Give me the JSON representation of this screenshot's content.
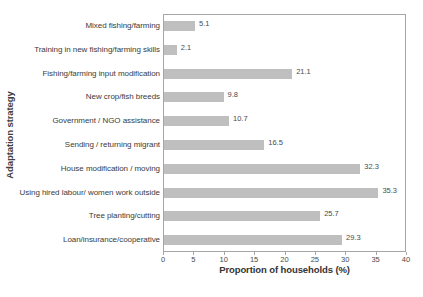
{
  "chart_data": {
    "type": "bar",
    "orientation": "horizontal",
    "title": "",
    "xlabel": "Proportion of households (%)",
    "ylabel": "Adaptation strategy",
    "xlim": [
      0,
      40
    ],
    "xticks": [
      0,
      5,
      10,
      15,
      20,
      25,
      30,
      35,
      40
    ],
    "xtick_labels": [
      "0",
      "5",
      "10",
      "15",
      "20",
      "25",
      "30",
      "35",
      "40"
    ],
    "grid": false,
    "legend": null,
    "bar_color": "#bfbfbf",
    "border_color": "#a6a6a6",
    "categories": [
      "Mixed fishing/farming",
      "Training in new fishing/farming skills",
      "Fishing/farming input modification",
      "New crop/fish breeds",
      "Government / NGO assistance",
      "Sending / returning migrant",
      "House modification / moving",
      "Using hired labour/ women work outside",
      "Tree planting/cutting",
      "Loan/insurance/cooperative"
    ],
    "values": [
      5.1,
      2.1,
      21.1,
      9.8,
      10.7,
      16.5,
      32.3,
      35.3,
      25.7,
      29.3
    ],
    "value_labels": [
      "5.1",
      "2.1",
      "21.1",
      "9.8",
      "10.7",
      "16.5",
      "32.3",
      "35.3",
      "25.7",
      "29.3"
    ]
  }
}
